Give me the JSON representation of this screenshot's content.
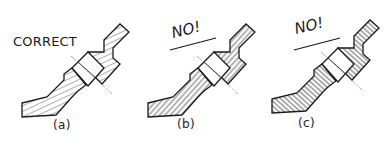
{
  "figure": {
    "panels": [
      {
        "id": "a",
        "label": "(a)",
        "note": "CORRECT",
        "hatch_style": "uniform 45-degree hatching, not parallel or perpendicular to outlines"
      },
      {
        "id": "b",
        "label": "(b)",
        "note": "NO!",
        "hatch_style": "hatching parallel to the part's main outline"
      },
      {
        "id": "c",
        "label": "(c)",
        "note": "NO!",
        "hatch_style": "hatching perpendicular to the part's main outline"
      }
    ]
  },
  "colors": {
    "line": "#1a1a1a",
    "hatch": "#3a3a3a",
    "centerline": "#777777",
    "background": "#ffffff"
  }
}
